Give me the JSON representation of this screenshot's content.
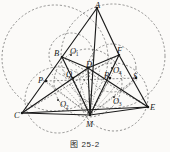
{
  "figure": {
    "caption": "图 25-2",
    "stroke_color": "#1a1a1a",
    "dash_color": "#333333",
    "background": "#fbfaf8"
  },
  "points": [
    {
      "id": "A",
      "label": "A",
      "sub": "",
      "x": 97,
      "y": 8,
      "lx": 95,
      "ly": 1,
      "dot": false
    },
    {
      "id": "B",
      "label": "B",
      "sub": "",
      "x": 62,
      "y": 57,
      "lx": 54,
      "ly": 49,
      "dot": false
    },
    {
      "id": "F",
      "label": "F",
      "sub": "",
      "x": 119,
      "y": 55,
      "lx": 117,
      "ly": 46,
      "dot": false
    },
    {
      "id": "C",
      "label": "C",
      "sub": "",
      "x": 22,
      "y": 113,
      "lx": 14,
      "ly": 111,
      "dot": false
    },
    {
      "id": "E",
      "label": "E",
      "sub": "",
      "x": 148,
      "y": 107,
      "lx": 150,
      "ly": 103,
      "dot": false
    },
    {
      "id": "M",
      "label": "M",
      "sub": "",
      "x": 90,
      "y": 115,
      "lx": 86,
      "ly": 120,
      "dot": false
    },
    {
      "id": "D",
      "label": "D",
      "sub": "",
      "x": 88,
      "y": 68,
      "lx": 86,
      "ly": 60,
      "dot": false
    },
    {
      "id": "P",
      "label": "P",
      "sub": "",
      "x": 46,
      "y": 81,
      "lx": 38,
      "ly": 76,
      "dot": false
    },
    {
      "id": "Q",
      "label": "Q",
      "sub": "",
      "x": 73,
      "y": 78,
      "lx": 66,
      "ly": 70,
      "dot": false
    },
    {
      "id": "R",
      "label": "R",
      "sub": "",
      "x": 110,
      "y": 78,
      "lx": 104,
      "ly": 71,
      "dot": false
    },
    {
      "id": "S",
      "label": "S",
      "sub": "",
      "x": 136,
      "y": 78,
      "lx": 133,
      "ly": 72,
      "dot": false
    },
    {
      "id": "O1",
      "label": "O",
      "sub": "1",
      "x": 71,
      "y": 55,
      "lx": 70,
      "ly": 47,
      "dot": true
    },
    {
      "id": "O2",
      "label": "O",
      "sub": "2",
      "x": 58,
      "y": 100,
      "lx": 60,
      "ly": 100,
      "dot": true
    },
    {
      "id": "O3",
      "label": "O",
      "sub": "3",
      "x": 114,
      "y": 97,
      "lx": 113,
      "ly": 97,
      "dot": true
    },
    {
      "id": "O4",
      "label": "O",
      "sub": "4",
      "x": 112,
      "y": 68,
      "lx": 113,
      "ly": 66,
      "dot": true
    }
  ],
  "solid_segments": [
    {
      "name": "segment-A-B",
      "from": "A",
      "to": "B"
    },
    {
      "name": "segment-A-F",
      "from": "A",
      "to": "F"
    },
    {
      "name": "segment-A-M",
      "from": "A",
      "to": "M"
    },
    {
      "name": "segment-B-C",
      "from": "B",
      "to": "C"
    },
    {
      "name": "segment-B-D",
      "from": "B",
      "to": "D"
    },
    {
      "name": "segment-D-F",
      "from": "D",
      "to": "F"
    },
    {
      "name": "segment-F-E",
      "from": "F",
      "to": "E"
    },
    {
      "name": "segment-C-E",
      "from": "C",
      "to": "E"
    },
    {
      "name": "segment-C-D",
      "from": "C",
      "to": "D"
    },
    {
      "name": "segment-D-E",
      "from": "D",
      "to": "E"
    },
    {
      "name": "segment-C-M",
      "from": "C",
      "to": "M"
    },
    {
      "name": "segment-M-E",
      "from": "M",
      "to": "E"
    },
    {
      "name": "segment-D-M",
      "from": "D",
      "to": "M"
    },
    {
      "name": "segment-B-M",
      "from": "B",
      "to": "M"
    },
    {
      "name": "segment-F-M",
      "from": "F",
      "to": "M"
    }
  ],
  "dashed_segments": [
    {
      "name": "segment-P-S",
      "from": "P",
      "to": "S"
    },
    {
      "name": "segment-P-M",
      "from": "P",
      "to": "M"
    },
    {
      "name": "segment-S-M",
      "from": "S",
      "to": "M"
    },
    {
      "name": "segment-Q-M",
      "from": "Q",
      "to": "M"
    },
    {
      "name": "segment-R-M",
      "from": "R",
      "to": "M"
    },
    {
      "name": "segment-B-E",
      "from": "B",
      "to": "E"
    },
    {
      "name": "segment-C-F",
      "from": "C",
      "to": "F"
    }
  ],
  "circles": [
    {
      "name": "circle-large-left",
      "cx": 55,
      "cy": 58,
      "r": 53,
      "style": "dashed"
    },
    {
      "name": "circle-large-right",
      "cx": 113,
      "cy": 56,
      "r": 52,
      "style": "dashed"
    },
    {
      "name": "circle-o1",
      "cx": 71,
      "cy": 55,
      "r": 22,
      "style": "dashed"
    },
    {
      "name": "circle-o2",
      "cx": 58,
      "cy": 100,
      "r": 33,
      "style": "dashed"
    },
    {
      "name": "circle-o3",
      "cx": 114,
      "cy": 97,
      "r": 34,
      "style": "dashed"
    },
    {
      "name": "circle-o4",
      "cx": 112,
      "cy": 68,
      "r": 24,
      "style": "dashed"
    },
    {
      "name": "circle-inner-mid",
      "cx": 88,
      "cy": 83,
      "r": 34,
      "style": "dashed"
    }
  ],
  "fan_lines_from_M": [
    {
      "name": "fan-line-M-1",
      "x": 40,
      "y": 78
    },
    {
      "name": "fan-line-M-2",
      "x": 52,
      "y": 74
    },
    {
      "name": "fan-line-M-3",
      "x": 64,
      "y": 71
    },
    {
      "name": "fan-line-M-4",
      "x": 76,
      "y": 69
    },
    {
      "name": "fan-line-M-5",
      "x": 100,
      "y": 69
    },
    {
      "name": "fan-line-M-6",
      "x": 114,
      "y": 71
    },
    {
      "name": "fan-line-M-7",
      "x": 126,
      "y": 74
    },
    {
      "name": "fan-line-M-8",
      "x": 138,
      "y": 79
    }
  ]
}
